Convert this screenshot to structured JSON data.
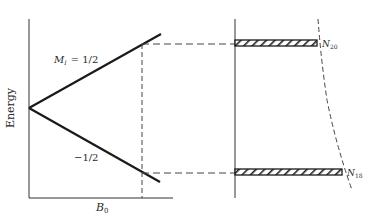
{
  "diagram": {
    "title": "",
    "y_axis_label": "Energy",
    "x_axis_label_main": "B",
    "x_axis_label_sub": "0",
    "upper_level_label_main": "M",
    "upper_level_label_sub": "I",
    "upper_level_value": "= 1/2",
    "lower_level_label": "−1/2",
    "upper_population_main": "N",
    "upper_population_sub": "20",
    "lower_population_main": "N",
    "lower_population_sub": "18",
    "colors": {
      "line": "#1a1a1a",
      "dashed": "#444444",
      "background": "#ffffff"
    }
  }
}
